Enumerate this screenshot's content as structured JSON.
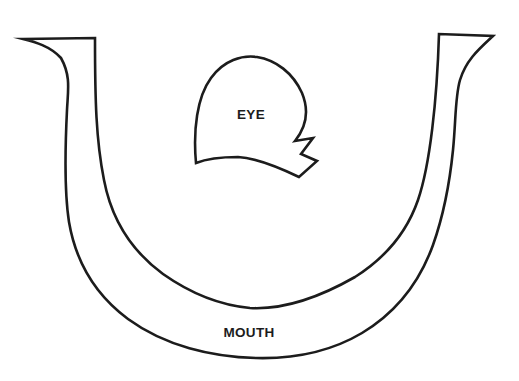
{
  "page": {
    "background_color": "#ffffff",
    "ink_color": "#1c1c1c"
  },
  "labels": {
    "eye": "EYE",
    "mouth": "MOUTH"
  }
}
